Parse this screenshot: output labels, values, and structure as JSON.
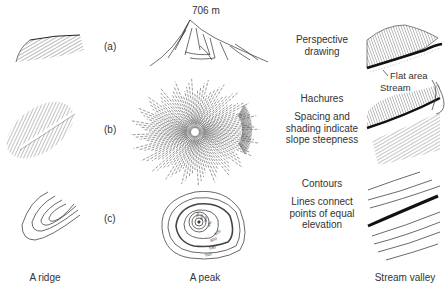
{
  "figure": {
    "rows": [
      {
        "id": "a",
        "label": "(a)",
        "method": "Perspective drawing",
        "method_lines": [
          "Perspective",
          "drawing"
        ]
      },
      {
        "id": "b",
        "label": "(b)",
        "method": "Hachures",
        "description_lines": [
          "Spacing and",
          "shading indicate",
          "slope steepness"
        ]
      },
      {
        "id": "c",
        "label": "(c)",
        "method": "Contours",
        "description_lines": [
          "Lines connect",
          "points of equal",
          "elevation"
        ]
      }
    ],
    "columns": [
      {
        "id": "ridge",
        "caption": "A ridge"
      },
      {
        "id": "peak",
        "caption": "A peak"
      },
      {
        "id": "valley",
        "caption": "Stream valley"
      }
    ],
    "annotations": {
      "peak_elevation": "706 m",
      "flat_area": "Flat area",
      "stream": "Stream"
    },
    "contour_labels": [
      "700",
      "680",
      "660",
      "640",
      "620",
      "600",
      "580",
      "560"
    ]
  }
}
